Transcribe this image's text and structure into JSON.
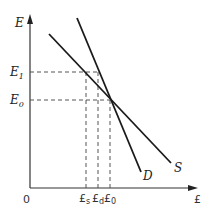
{
  "diagram": {
    "type": "supply-demand",
    "axes": {
      "y_label": "E",
      "x_label": "£",
      "origin": "0"
    },
    "y_ticks": [
      {
        "base": "E",
        "sub": "1"
      },
      {
        "base": "E",
        "sub": "0"
      }
    ],
    "x_ticks": [
      {
        "base": "£",
        "sub": "s"
      },
      {
        "base": "£",
        "sub": "d"
      },
      {
        "base": "£",
        "sub": "0"
      }
    ],
    "curves": [
      {
        "name": "S",
        "label": "S"
      },
      {
        "name": "D",
        "label": "D"
      }
    ],
    "colors": {
      "line": "#1a1a1a",
      "dash": "#555555"
    }
  }
}
